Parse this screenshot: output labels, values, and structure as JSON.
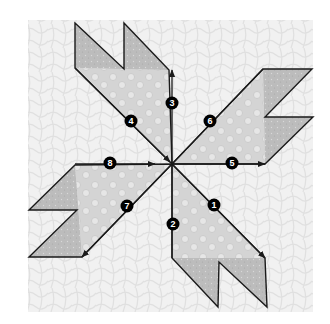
{
  "diagram": {
    "title": "",
    "colors": {
      "background": "#ffffff",
      "quilted_fabric": "#eeeeee",
      "arm_light": "#d2d2d2",
      "arm_dark_tips": "#b9b9b9",
      "outline": "#1a1a1a",
      "badge_fill": "#000000",
      "badge_text": "#ffffff"
    },
    "center": {
      "x": 172,
      "y": 164
    },
    "steps": [
      {
        "label": "1",
        "x": 214,
        "y": 205,
        "direction": "down-right"
      },
      {
        "label": "2",
        "x": 173,
        "y": 224,
        "direction": "down"
      },
      {
        "label": "3",
        "x": 172,
        "y": 103,
        "direction": "up"
      },
      {
        "label": "4",
        "x": 131,
        "y": 121,
        "direction": "up-left"
      },
      {
        "label": "5",
        "x": 232,
        "y": 163,
        "direction": "right"
      },
      {
        "label": "6",
        "x": 210,
        "y": 121,
        "direction": "up-right"
      },
      {
        "label": "7",
        "x": 127,
        "y": 206,
        "direction": "down-left"
      },
      {
        "label": "8",
        "x": 110,
        "y": 163,
        "direction": "right"
      }
    ]
  }
}
